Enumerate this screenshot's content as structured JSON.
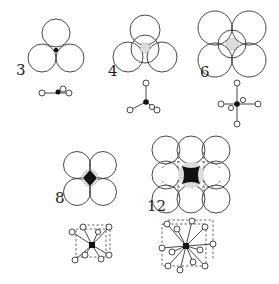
{
  "figure": {
    "panels": [
      {
        "id": "cn3",
        "label": "3",
        "geometry": "triangular"
      },
      {
        "id": "cn4",
        "label": "4",
        "geometry": "tetrahedral"
      },
      {
        "id": "cn6",
        "label": "6",
        "geometry": "octahedral"
      },
      {
        "id": "cn8",
        "label": "8",
        "geometry": "cubic"
      },
      {
        "id": "cn12",
        "label": "12",
        "geometry": "cuboctahedral"
      }
    ]
  },
  "colors": {
    "line": "#333333",
    "central_atom": "#111111",
    "background": "#ffffff"
  }
}
